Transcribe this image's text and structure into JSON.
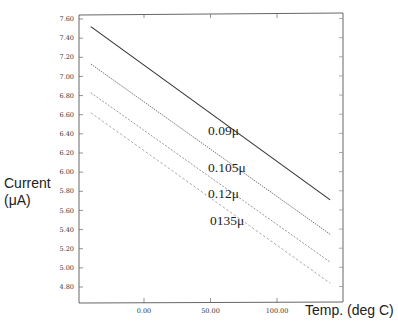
{
  "chart_data": {
    "type": "line",
    "title": "",
    "xlabel": "Temp. (deg C)",
    "ylabel_line1": "Current",
    "ylabel_line2": "(μA)",
    "xlim": [
      -48,
      150
    ],
    "ylim": [
      4.64,
      7.64
    ],
    "x_ticks": [
      "0.00",
      "50.00",
      "100.00"
    ],
    "y_ticks": [
      "7.60",
      "7.40",
      "7.20",
      "7.00",
      "6.80",
      "6.60",
      "6.40",
      "6.20",
      "6.00",
      "5.80",
      "5.60",
      "5.40",
      "5.20",
      "5.00",
      "4.80"
    ],
    "grid": false,
    "legend": "inline labels",
    "x": [
      -40,
      140
    ],
    "series": [
      {
        "name": "0.09μ",
        "values": [
          7.52,
          5.71
        ],
        "style": "solid",
        "color": "#333333"
      },
      {
        "name": "0.105μ",
        "values": [
          7.13,
          5.35
        ],
        "style": "dotted-fine",
        "color": "#777777"
      },
      {
        "name": "0.12μ",
        "values": [
          6.83,
          5.06
        ],
        "style": "dashed-fine",
        "color": "#999999"
      },
      {
        "name": "0135μ",
        "values": [
          6.62,
          4.84
        ],
        "style": "dashed",
        "color": "#aaaaaa"
      }
    ]
  }
}
